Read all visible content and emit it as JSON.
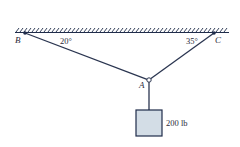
{
  "diagram": {
    "points": {
      "B": {
        "label": "B",
        "x": 25,
        "y": 33
      },
      "C": {
        "label": "C",
        "x": 214,
        "y": 33
      },
      "A": {
        "label": "A",
        "x": 149,
        "y": 80
      }
    },
    "angles": {
      "at_B": "20°",
      "at_C": "35°"
    },
    "load": {
      "label": "200 lb"
    },
    "colors": {
      "line": "#2a3550",
      "box_fill": "#d3dde6",
      "box_stroke": "#1f2c4a",
      "ceiling": "#1f2c4a"
    }
  }
}
